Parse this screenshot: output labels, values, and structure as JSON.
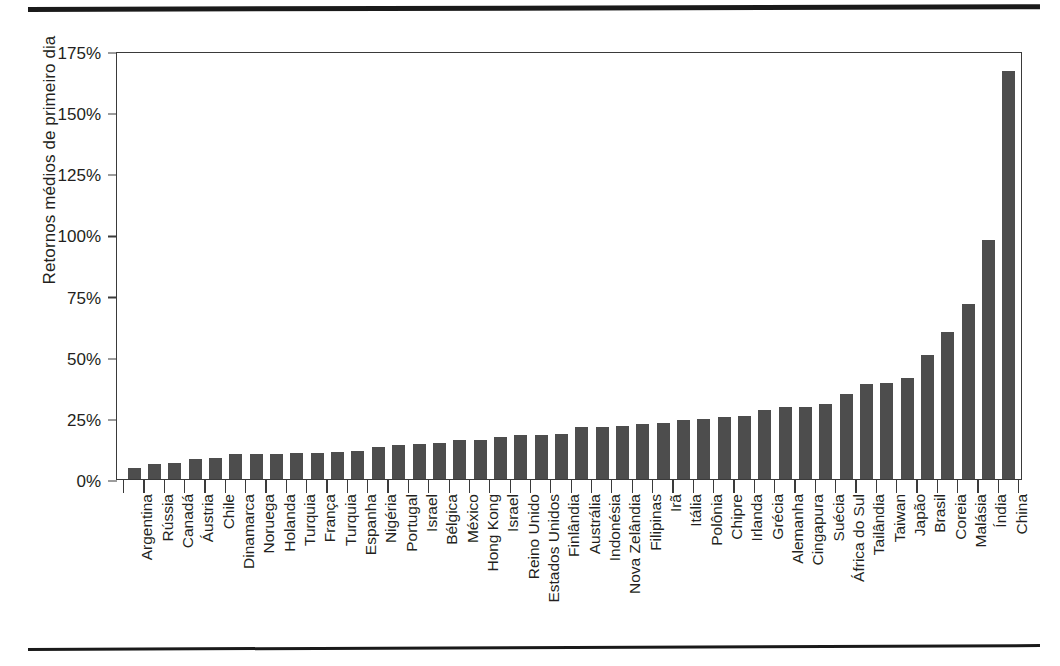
{
  "figure": {
    "name": "first-day-returns-by-country-bar-chart",
    "rules": {
      "top_rule": "horizontal-rule",
      "bottom_rule": "horizontal-rule"
    }
  },
  "chart_data": {
    "type": "bar",
    "title": "",
    "xlabel": "",
    "ylabel": "Retornos médios de primeiro dia",
    "ylim": [
      0,
      175
    ],
    "ytick_labels": [
      "0%",
      "25%",
      "50%",
      "75%",
      "100%",
      "125%",
      "150%",
      "175%"
    ],
    "ytick_values": [
      0,
      25,
      50,
      75,
      100,
      125,
      150,
      175
    ],
    "grid": false,
    "legend": null,
    "bar_color": "#4d4d4d",
    "axis_color": "#3a3a3a",
    "categories": [
      "Argentina",
      "Rússia",
      "Canadá",
      "Áustria",
      "Chile",
      "Dinamarca",
      "Noruega",
      "Holanda",
      "Turquia",
      "França",
      "Turquia",
      "Espanha",
      "Nigéria",
      "Portugal",
      "Israel",
      "Bélgica",
      "México",
      "Hong Kong",
      "Israel",
      "Reino Unido",
      "Estados Unidos",
      "Finlândia",
      "Austrália",
      "Indonésia",
      "Nova Zelândia",
      "Filipinas",
      "Irã",
      "Itália",
      "Polônia",
      "Chipre",
      "Irlanda",
      "Grécia",
      "Alemanha",
      "Cingapura",
      "Suécia",
      "África do Sul",
      "Tailândia",
      "Taiwan",
      "Japão",
      "Brasil",
      "Coreia",
      "Malásia",
      "Índia",
      "China"
    ],
    "values": [
      4.4,
      6.3,
      6.5,
      8.2,
      8.4,
      10.1,
      10.2,
      10.2,
      10.7,
      10.7,
      11.2,
      11.6,
      13.1,
      13.9,
      14.4,
      14.6,
      15.9,
      15.9,
      17.3,
      18.0,
      18.0,
      18.5,
      21.1,
      21.2,
      21.5,
      22.6,
      23.1,
      24.0,
      24.5,
      25.4,
      25.9,
      28.2,
      29.4,
      29.5,
      30.5,
      34.9,
      38.8,
      39.1,
      41.5,
      50.6,
      60.1,
      71.6,
      97.7,
      166.7
    ]
  }
}
